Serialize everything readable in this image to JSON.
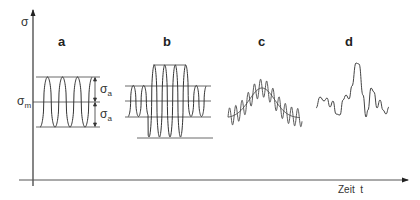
{
  "figure": {
    "y_axis_label": "σ",
    "x_axis_label": "Zeit  t",
    "mean_label": {
      "symbol": "σ",
      "sub": "m"
    },
    "amplitude_labels": [
      {
        "symbol": "σ",
        "sub": "a"
      },
      {
        "symbol": "σ",
        "sub": "a"
      }
    ],
    "panels": [
      {
        "id": "a",
        "label": "a",
        "description": "constant amplitude sinusoidal loading"
      },
      {
        "id": "b",
        "label": "b",
        "description": "block loading with varying amplitude"
      },
      {
        "id": "c",
        "label": "c",
        "description": "superimposed oscillation on slowly varying mean"
      },
      {
        "id": "d",
        "label": "d",
        "description": "random (stochastic) loading"
      }
    ]
  },
  "colors": {
    "line": "#333333",
    "axis": "#222222",
    "background": "#ffffff"
  }
}
